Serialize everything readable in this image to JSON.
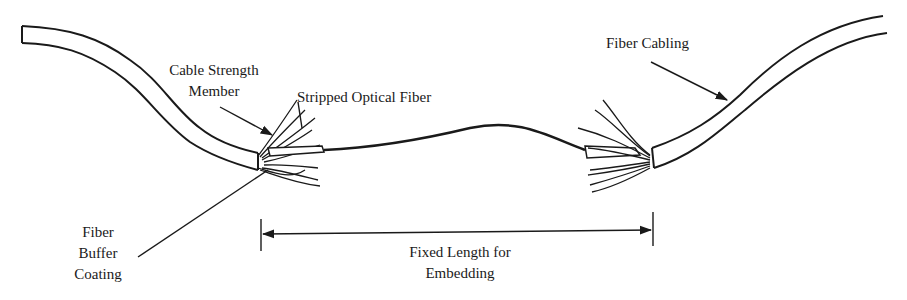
{
  "diagram": {
    "type": "labeled-illustration",
    "labels": {
      "cable_strength_member": [
        "Cable Strength",
        "Member"
      ],
      "stripped_optical_fiber": "Stripped Optical Fiber",
      "fiber_cabling": "Fiber Cabling",
      "fiber_buffer_coating": [
        "Fiber",
        "Buffer",
        "Coating"
      ],
      "fixed_length": [
        "Fixed Length for",
        "Embedding"
      ]
    },
    "colors": {
      "stroke": "#1a1a1a",
      "background": "#ffffff"
    }
  }
}
